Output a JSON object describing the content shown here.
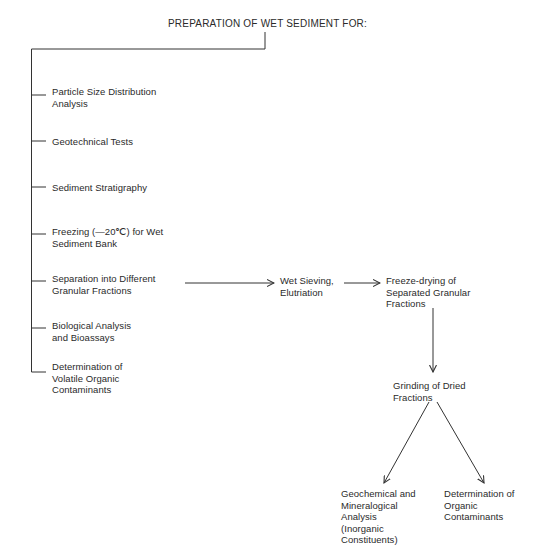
{
  "title": "PREPARATION OF WET SEDIMENT FOR:",
  "branches": [
    {
      "label": "Particle Size Distribution\nAnalysis"
    },
    {
      "label": "Geotechnical Tests"
    },
    {
      "label": "Sediment Stratigraphy"
    },
    {
      "label": "Freezing (—20℃) for Wet\nSediment Bank"
    },
    {
      "label": "Separation into Different\nGranular Fractions"
    },
    {
      "label": "Biological Analysis\nand Bioassays"
    },
    {
      "label": "Determination of\nVolatile Organic\nContaminants"
    }
  ],
  "flow": {
    "wet_sieving": "Wet Sieving,\nElutriation",
    "freeze_drying": "Freeze-drying of\nSeparated Granular\nFractions",
    "grinding": "Grinding of Dried\nFractions",
    "geochemical": "Geochemical and\nMineralogical\nAnalysis\n(Inorganic\nConstituents)",
    "organic": "Determination of\nOrganic\nContaminants"
  },
  "colors": {
    "line": "#333333",
    "text": "#2a2a2a",
    "background": "#ffffff"
  }
}
